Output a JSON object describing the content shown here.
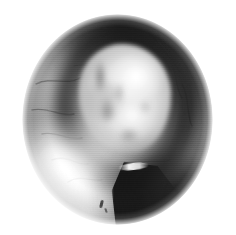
{
  "image": {
    "modality": "endoscopic",
    "title": "Otoendoscopic view",
    "color_mode": "grayscale",
    "background_color": "#ffffff",
    "field_of_view_shape": "circle",
    "width": 236,
    "height": 235
  },
  "field_of_view": {
    "center_x": 117,
    "center_y": 119,
    "radius_x": 95,
    "radius_y": 105,
    "edge": "feathered",
    "base_color": "#8e8e8e"
  },
  "regions": [
    {
      "name": "canal-wall",
      "label": "Canal wall",
      "tone": "mid-gray",
      "color": "#8a8a8a"
    },
    {
      "name": "upper-rim",
      "label": "Upper shadowed rim",
      "tone": "dark",
      "color": "#1e1e1e"
    },
    {
      "name": "recess-shadow",
      "label": "Shadowed recess ring",
      "tone": "dark",
      "color": "#222222"
    },
    {
      "name": "crescent-right",
      "label": "Right crescent shadow",
      "tone": "very-dark",
      "color": "#0c0c0c"
    },
    {
      "name": "central-mass",
      "label": "Central lobulated mass",
      "tone": "bright",
      "color": "#e8e8e8"
    },
    {
      "name": "floor-glare",
      "label": "Lower-left illumination glare",
      "tone": "bright",
      "color": "#fdfdfd"
    },
    {
      "name": "lower-dark-pocket",
      "label": "Lower-right deep pocket",
      "tone": "very-dark",
      "color": "#111111"
    },
    {
      "name": "instrument-wedge",
      "label": "Wedge-shaped instrument shadow",
      "tone": "very-dark",
      "color": "#1a1a1a"
    },
    {
      "name": "instrument-highlight",
      "label": "Specular highlight on instrument edge",
      "tone": "white",
      "color": "#fafafa"
    },
    {
      "name": "debris-speck",
      "label": "Debris speck",
      "tone": "dark",
      "color": "#1e1e1e"
    }
  ],
  "overlays": {
    "scanlines": true,
    "vignette": true,
    "text_annotations": []
  }
}
